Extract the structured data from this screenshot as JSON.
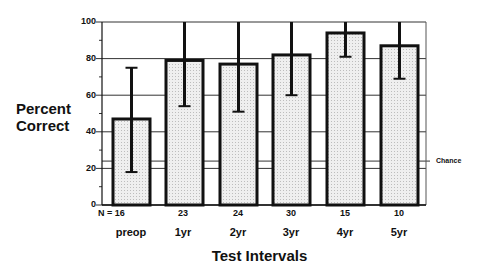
{
  "chart_data": {
    "type": "bar",
    "title": "",
    "xlabel": "Test Intervals",
    "ylabel": "Percent Correct",
    "ylim": [
      0,
      100
    ],
    "yticks": [
      0,
      20,
      40,
      60,
      80,
      100
    ],
    "categories": [
      "preop",
      "1yr",
      "2yr",
      "3yr",
      "4yr",
      "5yr"
    ],
    "n_label_prefix": "N = ",
    "n_values": [
      16,
      23,
      24,
      30,
      15,
      10
    ],
    "values": [
      47,
      79,
      77,
      82,
      94,
      87
    ],
    "error_low": [
      18,
      54,
      51,
      60,
      81,
      69
    ],
    "error_high": [
      75,
      100,
      100,
      100,
      100,
      100
    ],
    "reference_line": {
      "label": "Chance",
      "value": 24
    },
    "grid": true,
    "legend": null
  },
  "labels": {
    "ylabel_line1": "Percent",
    "ylabel_line2": "Correct",
    "xlabel": "Test Intervals",
    "chance": "Chance",
    "n": [
      "N = 16",
      "23",
      "24",
      "30",
      "15",
      "10"
    ],
    "categories": [
      "preop",
      "1yr",
      "2yr",
      "3yr",
      "4yr",
      "5yr"
    ],
    "yticks": [
      "100",
      "80",
      "60",
      "40",
      "20",
      "0"
    ]
  },
  "colors": {
    "bar_fill": "#e4e4e4",
    "bar_stroke": "#111111",
    "grid": "#333333"
  }
}
